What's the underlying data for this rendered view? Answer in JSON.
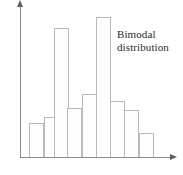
{
  "figure": {
    "background_color": "#ffffff",
    "width": 183,
    "height": 175
  },
  "annotation": {
    "line1": "Bimodal",
    "line2": "distribution"
  },
  "axes": {
    "y_axis_name": "vertical-axis",
    "x_axis_name": "horizontal-axis",
    "axis_color": "#8a8a8a",
    "arrow_color": "#5d5d5d",
    "baseline_y": 157,
    "origin_x": 20,
    "x_axis_end": 172,
    "y_axis_top": 5
  },
  "bar_style": {
    "fill_color": "#fdfdfd",
    "stroke_color": "#b9b9b9",
    "width_px": 15
  },
  "chart_data": {
    "type": "bar",
    "title": "",
    "subtitle": "",
    "xlabel": "",
    "ylabel": "",
    "grid": false,
    "legend": false,
    "annotations": [
      "Bimodal distribution"
    ],
    "categories": [
      "1",
      "2",
      "3",
      "4",
      "5",
      "6",
      "7",
      "8",
      "9"
    ],
    "values": [
      34,
      40,
      129,
      49,
      63,
      140,
      56,
      47,
      24
    ],
    "ylim": [
      0,
      152
    ],
    "xlim": [
      0,
      9
    ],
    "bar_geometry": [
      {
        "category": "1",
        "left": 29,
        "top": 123,
        "width": 15,
        "height": 34
      },
      {
        "category": "2",
        "left": 44,
        "top": 117,
        "width": 15,
        "height": 40
      },
      {
        "category": "3",
        "left": 54,
        "top": 28,
        "width": 15,
        "height": 129
      },
      {
        "category": "4",
        "left": 67,
        "top": 108,
        "width": 15,
        "height": 49
      },
      {
        "category": "5",
        "left": 82,
        "top": 94,
        "width": 15,
        "height": 63
      },
      {
        "category": "6",
        "left": 96,
        "top": 17,
        "width": 15,
        "height": 140
      },
      {
        "category": "7",
        "left": 110,
        "top": 101,
        "width": 15,
        "height": 56
      },
      {
        "category": "8",
        "left": 124,
        "top": 110,
        "width": 15,
        "height": 47
      },
      {
        "category": "9",
        "left": 139,
        "top": 133,
        "width": 15,
        "height": 24
      }
    ]
  }
}
